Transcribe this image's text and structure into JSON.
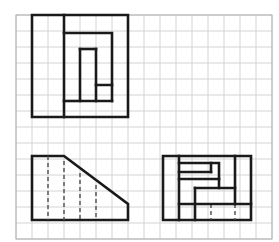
{
  "sheet": {
    "title": "Orthographic Projection Worksheet",
    "width": 279,
    "height": 242,
    "background_color": "#ffffff",
    "grid": {
      "label": "graph-paper-grid",
      "origin_x": 16,
      "origin_y": 15,
      "cell_size": 16,
      "columns": 16,
      "rows": 14,
      "line_color": "#c9c9c9",
      "line_width": 0.8,
      "border_color": "#b0b0b0",
      "border_width": 1
    },
    "line_style": {
      "visible_edge_color": "#1a1a1a",
      "visible_edge_width": 2.6,
      "hidden_edge_color": "#4d4d4d",
      "hidden_edge_width": 1.4,
      "hidden_dash_pattern": "4,3"
    }
  },
  "views": [
    {
      "id": "top-view",
      "name": "Top View",
      "description": "Square outline with a rectangular slot and a narrow notch cut inward",
      "outline_points": "32,15 128,15 128,117 32,117",
      "interior_paths": [
        "64,15 64,117",
        "64,33 112,33 112,85 96,85",
        "80,49 80,101 112,101",
        "96,49 96,101",
        "80,49 96,49",
        "64,101 80,101",
        "112,85 112,101"
      ],
      "hidden_paths": []
    },
    {
      "id": "front-view",
      "name": "Front View",
      "description": "Trapezoid: flat top left, chamfered slope down to the right, with four hidden vertical edges",
      "outline_points": "32,156 64,156 128,204 128,220 32,220",
      "interior_paths": [],
      "hidden_paths": [
        "48,156 48,220",
        "64,161 64,220",
        "80,173 80,220",
        "96,185 96,220"
      ]
    },
    {
      "id": "right-side-view",
      "name": "Right Side View",
      "description": "Rectangle containing a stepped Z-shaped internal profile with hidden edges at the base",
      "outline_points": "163,156 251,156 251,220 163,220",
      "interior_paths": [
        "179,156 179,220",
        "179,163 219,163 219,188",
        "179,179 219,179",
        "179,172 211,172",
        "211,163 211,172",
        "235,156 235,204",
        "195,188 235,188",
        "195,188 195,220",
        "179,204 251,204"
      ],
      "hidden_paths": [
        "211,204 211,220",
        "235,204 235,220"
      ]
    }
  ]
}
